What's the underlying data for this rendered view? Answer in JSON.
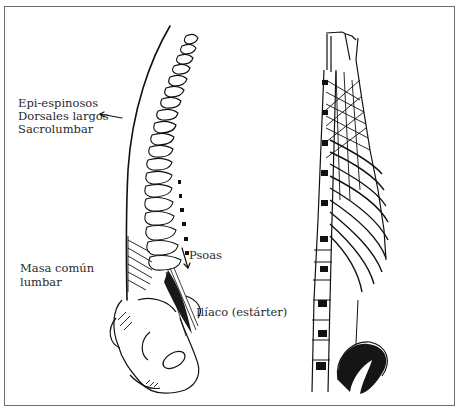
{
  "figure": {
    "left_panel": {
      "title": "Lateral view of spine with muscle groups",
      "labels": {
        "upper_group": [
          "Epi-espinosos",
          "Dorsales largos",
          "Sacrolumbar"
        ],
        "lower_group": [
          "Masa común",
          "lumbar"
        ],
        "psoas": "Psoas",
        "iliaco": "Ilíaco (estárter)"
      }
    },
    "right_panel": {
      "title": "Posterior-lateral view of trunk musculature and ribs"
    },
    "colors": {
      "ink": "#111111",
      "border": "#6e6e6e",
      "background": "#ffffff",
      "text": "#2a2a2a"
    }
  }
}
